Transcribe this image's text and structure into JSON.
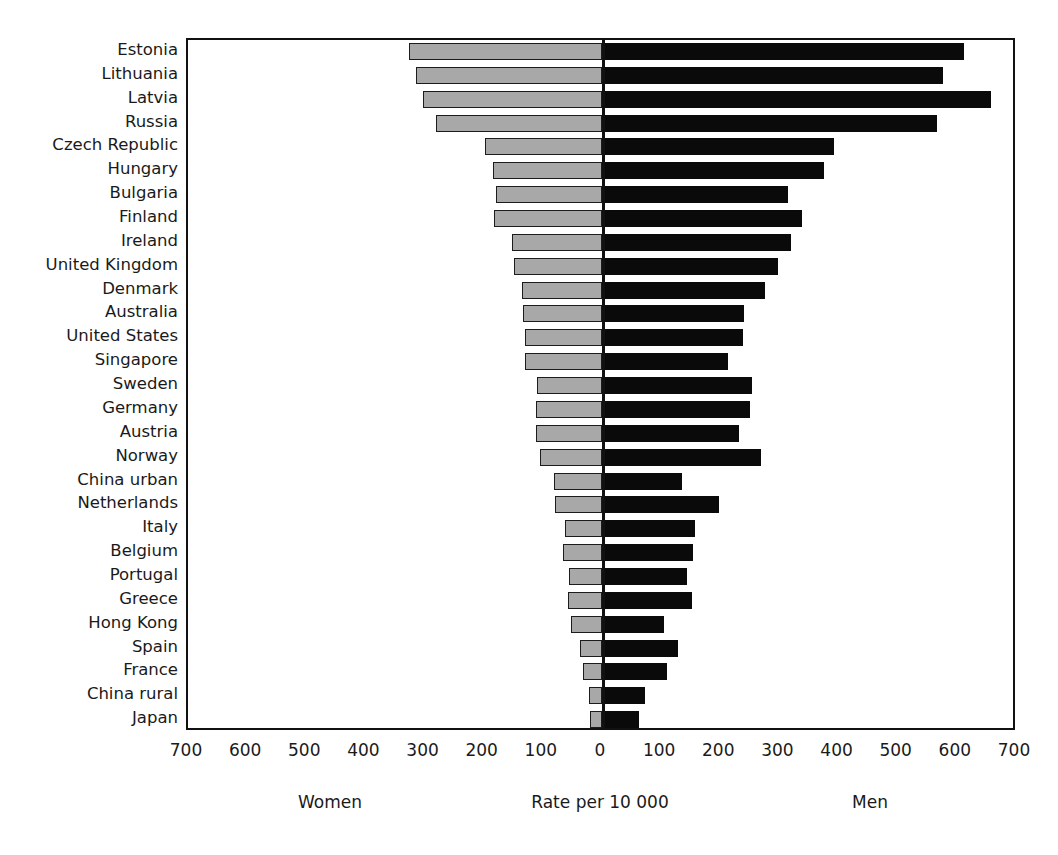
{
  "chart_data": {
    "type": "bar",
    "subtype": "diverging-horizontal-population-pyramid",
    "title": "",
    "xlabel": "Rate per 10 000",
    "ylabel": "",
    "grid": false,
    "legend_position": "below-axis",
    "axis": {
      "left_label": "Women",
      "center_label": "Rate per 10 000",
      "right_label": "Men",
      "tick_labels": [
        "700",
        "600",
        "500",
        "400",
        "300",
        "200",
        "100",
        "0",
        "100",
        "200",
        "300",
        "400",
        "500",
        "600",
        "700"
      ],
      "tick_values": [
        -700,
        -600,
        -500,
        -400,
        -300,
        -200,
        -100,
        0,
        100,
        200,
        300,
        400,
        500,
        600,
        700
      ],
      "xlim": [
        -700,
        700
      ],
      "tick_step": 100
    },
    "series": [
      {
        "name": "Women",
        "color": "#a8a8a8",
        "side": "left"
      },
      {
        "name": "Men",
        "color": "#0a0a0a",
        "side": "right"
      }
    ],
    "categories": [
      "Estonia",
      "Lithuania",
      "Latvia",
      "Russia",
      "Czech Republic",
      "Hungary",
      "Bulgaria",
      "Finland",
      "Ireland",
      "United Kingdom",
      "Denmark",
      "Australia",
      "United States",
      "Singapore",
      "Sweden",
      "Germany",
      "Austria",
      "Norway",
      "China urban",
      "Netherlands",
      "Italy",
      "Belgium",
      "Portugal",
      "Greece",
      "Hong Kong",
      "Spain",
      "France",
      "China rural",
      "Japan"
    ],
    "women": [
      327,
      314,
      302,
      280,
      198,
      185,
      180,
      182,
      152,
      148,
      135,
      133,
      130,
      130,
      110,
      112,
      112,
      105,
      82,
      80,
      62,
      66,
      56,
      58,
      52,
      38,
      32,
      22,
      20
    ],
    "men": [
      612,
      577,
      657,
      567,
      393,
      375,
      315,
      339,
      319,
      298,
      276,
      240,
      238,
      213,
      253,
      250,
      231,
      268,
      136,
      197,
      157,
      154,
      143,
      152,
      104,
      128,
      110,
      72,
      63
    ]
  },
  "figure": {
    "background": "#ffffff",
    "axis_color": "#111111",
    "text_color": "#1a1a1a",
    "women_fill": "#a8a8a8",
    "men_fill": "#0a0a0a"
  }
}
